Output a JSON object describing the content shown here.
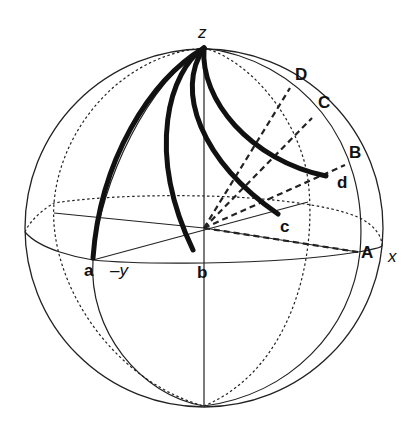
{
  "diagram": {
    "type": "sphere-projection",
    "axes": {
      "z": "z",
      "x": "x",
      "neg_y": "–y"
    },
    "equator_points": {
      "a": "a",
      "b": "b",
      "A": "A"
    },
    "arc_endpoints": {
      "c": "c",
      "d": "d"
    },
    "rim_points": {
      "B": "B",
      "C": "C",
      "D": "D"
    },
    "colors": {
      "stroke": "#222222",
      "background": "#ffffff"
    }
  }
}
